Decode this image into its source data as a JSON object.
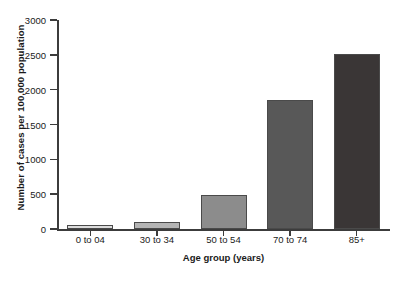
{
  "chart_data": {
    "type": "bar",
    "title": "",
    "xlabel": "Age group (years)",
    "ylabel": "Number of cases per 100,000 population",
    "categories": [
      "0 to 04",
      "30 to 34",
      "50 to 54",
      "70 to 74",
      "85+"
    ],
    "values": [
      55,
      95,
      490,
      1850,
      2510
    ],
    "series": [
      {
        "name": "Number of cases per 100,000 population",
        "values": [
          55,
          95,
          490,
          1850,
          2510
        ]
      }
    ],
    "bar_colors": [
      "#dcdcdc",
      "#b4b4b4",
      "#8c8c8c",
      "#585858",
      "#3a3636"
    ],
    "bar_border_color": "#4a4a4a",
    "ylim": [
      0,
      3000
    ],
    "ytick_values": [
      0,
      500,
      1000,
      1500,
      2000,
      2500,
      3000
    ],
    "ytick_labels": [
      "0",
      "500",
      "1000",
      "1500",
      "2000",
      "2500",
      "3000"
    ],
    "grid": false,
    "legend": false,
    "legend_position": "none",
    "axis_color": "#3c3c3c",
    "background_color": "#ffffff"
  }
}
